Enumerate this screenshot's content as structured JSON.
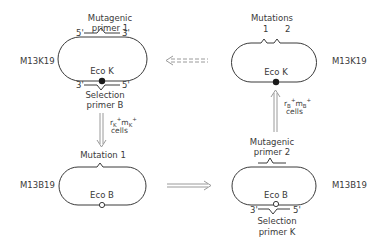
{
  "diagram": {
    "colors": {
      "line": "#3a3a3a",
      "arrow": "#9a9a9a",
      "background": "#ffffff"
    },
    "top_left": {
      "plasmid_label": "M13K19",
      "primer_top_label_1": "Mutagenic",
      "primer_top_label_2": "primer 1",
      "primer_top_5": "5'",
      "primer_top_3": "3'",
      "site_label": "Eco K",
      "site_marker": "filled-circle",
      "primer_bottom_3": "3'",
      "primer_bottom_5": "5'",
      "primer_bottom_label_1": "Selection",
      "primer_bottom_label_2": "primer B"
    },
    "top_right": {
      "plasmid_label": "M13K19",
      "mutations_label": "Mutations",
      "mutation_1": "1",
      "mutation_2": "2",
      "site_label": "Eco K",
      "site_marker": "filled-circle"
    },
    "bottom_left": {
      "plasmid_label": "M13B19",
      "mutation_label": "Mutation 1",
      "site_label": "Eco B",
      "site_marker": "open-circle"
    },
    "bottom_right": {
      "plasmid_label": "M13B19",
      "primer_top_label_1": "Mutagenic",
      "primer_top_label_2": "primer 2",
      "site_label": "Eco B",
      "site_marker": "open-circle",
      "primer_bottom_3": "3'",
      "primer_bottom_5": "5'",
      "primer_bottom_label_1": "Selection",
      "primer_bottom_label_2": "primer K"
    },
    "arrows": {
      "down_left": {
        "direction": "down",
        "label_r": "r",
        "label_r_sub": "K",
        "label_r_sup": "+",
        "label_m": "m",
        "label_m_sub": "K",
        "label_m_sup": "+",
        "label_cells": "cells"
      },
      "right_bottom": {
        "direction": "right",
        "style": "solid-double"
      },
      "up_right": {
        "direction": "up",
        "label_r": "r",
        "label_r_sub": "B",
        "label_r_sup": "+",
        "label_m": "m",
        "label_m_sub": "B",
        "label_m_sup": "+",
        "label_cells": "cells"
      },
      "left_top": {
        "direction": "left",
        "style": "dashed-double"
      }
    }
  }
}
